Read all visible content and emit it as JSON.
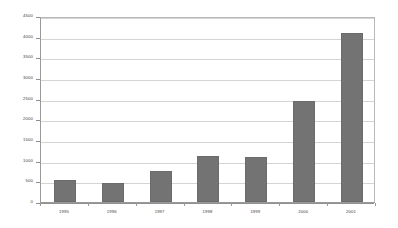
{
  "chart_data": {
    "type": "bar",
    "title": "",
    "subtitle": "",
    "xlabel": "",
    "ylabel": "",
    "categories": [
      "1995",
      "1996",
      "1997",
      "1998",
      "1999",
      "2000",
      "2001"
    ],
    "values": [
      530,
      450,
      750,
      1120,
      1100,
      2450,
      4100
    ],
    "series": [
      {
        "name": "",
        "values": [
          530,
          450,
          750,
          1120,
          1100,
          2450,
          4100
        ]
      }
    ],
    "ylim": [
      0,
      4500
    ],
    "xlim": null,
    "ytick_labels": [
      "0",
      "500",
      "1000",
      "1500",
      "2000",
      "2500",
      "3000",
      "3500",
      "4000",
      "4500"
    ],
    "ytick_values": [
      0,
      500,
      1000,
      1500,
      2000,
      2500,
      3000,
      3500,
      4000,
      4500
    ],
    "xtick_labels": [
      "1995",
      "1996",
      "1997",
      "1998",
      "1999",
      "2000",
      "2001"
    ],
    "grid": "horizontal",
    "legend": null,
    "legend_position": "none",
    "annotations": [],
    "colors": {
      "bar_fill": "#737373",
      "bar_stroke": "#6b6b6b",
      "gridline": "#d4d4d4",
      "axis_line": "#8f8f8f",
      "frame": "#b8b8b8",
      "background": "#ffffff",
      "tick_text": "#3a3a3a"
    }
  }
}
